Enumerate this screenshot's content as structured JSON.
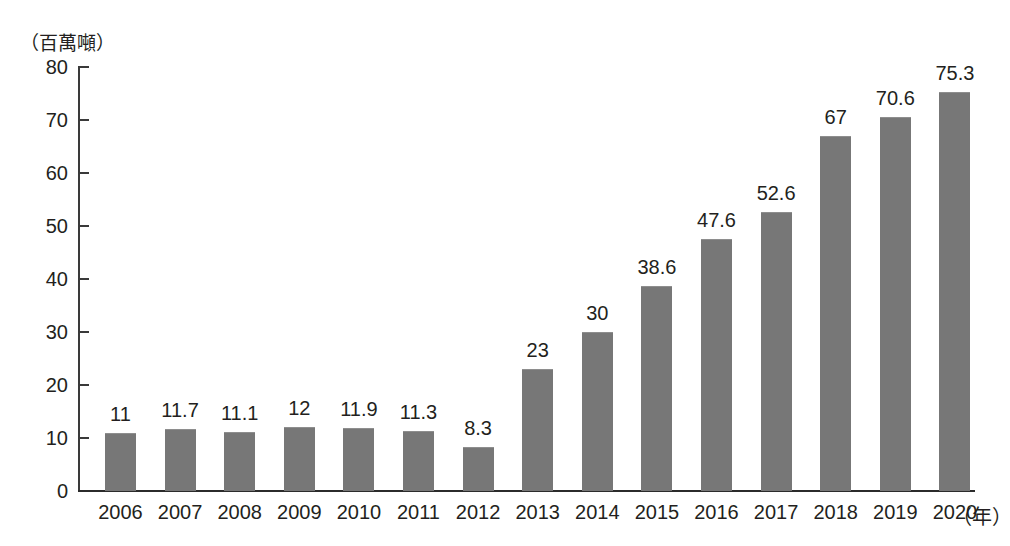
{
  "chart_data": {
    "type": "bar",
    "title": "",
    "subtitle": "",
    "xlabel": "（年）",
    "ylabel": "（百萬噸）",
    "categories": [
      "2006",
      "2007",
      "2008",
      "2009",
      "2010",
      "2011",
      "2012",
      "2013",
      "2014",
      "2015",
      "2016",
      "2017",
      "2018",
      "2019",
      "2020"
    ],
    "values": [
      11,
      11.7,
      11.1,
      12,
      11.9,
      11.3,
      8.3,
      23,
      30,
      38.6,
      47.6,
      52.6,
      67,
      70.6,
      75.3
    ],
    "value_labels": [
      "11",
      "11.7",
      "11.1",
      "12",
      "11.9",
      "11.3",
      "8.3",
      "23",
      "30",
      "38.6",
      "47.6",
      "52.6",
      "67",
      "70.6",
      "75.3"
    ],
    "ylim": [
      0,
      80
    ],
    "ytick_values": [
      0,
      10,
      20,
      30,
      40,
      50,
      60,
      70,
      80
    ],
    "ytick_labels": [
      "0",
      "10",
      "20",
      "30",
      "40",
      "50",
      "60",
      "70",
      "80"
    ],
    "grid": false,
    "legend": false,
    "legend_position": "none",
    "bar_color": "#777777",
    "axis_color": "#2b2b2b",
    "text_color": "#231f20",
    "background": "#ffffff"
  }
}
